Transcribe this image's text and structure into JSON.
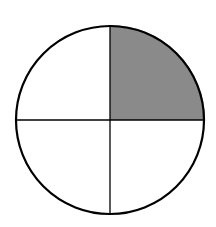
{
  "diagram": {
    "type": "fraction-circle",
    "total_parts": 4,
    "shaded_parts": 1,
    "shaded_quadrant": "top-right",
    "fraction_label": "1/4",
    "colors": {
      "outline": "#000000",
      "shade": "#8a8a8a",
      "background": "#ffffff"
    }
  }
}
